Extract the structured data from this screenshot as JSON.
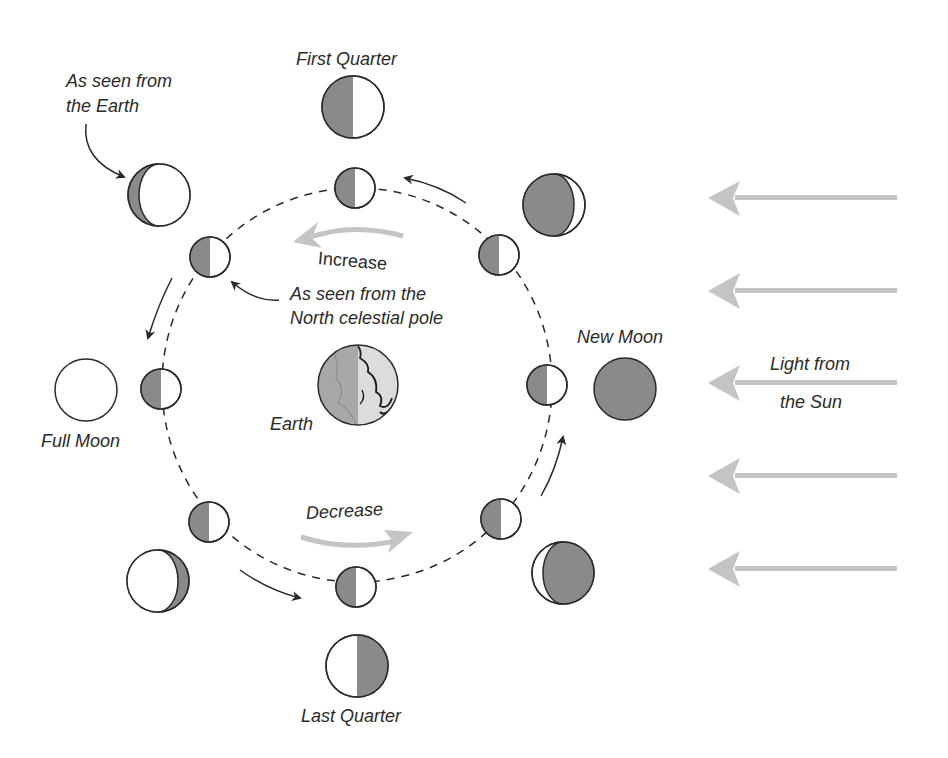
{
  "labels": {
    "first_quarter": "First Quarter",
    "last_quarter": "Last Quarter",
    "full_moon": "Full Moon",
    "new_moon": "New Moon",
    "earth": "Earth",
    "seen_from_earth_1": "As seen from",
    "seen_from_earth_2": "the Earth",
    "seen_from_pole_1": "As seen from the",
    "seen_from_pole_2": "North celestial pole",
    "increase": "Increase",
    "decrease": "Decrease",
    "light_1": "Light from",
    "light_2": "the Sun"
  },
  "colors": {
    "shadow": "#8a8a8a",
    "lit": "#ffffff",
    "outline": "#2a2a2a",
    "sun_arrow": "#c4c4c4",
    "earth_dark": "#a8a8a8",
    "earth_light": "#dcdcdc"
  }
}
